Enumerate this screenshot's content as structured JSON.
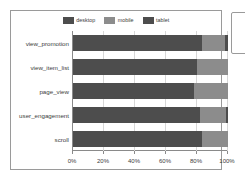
{
  "chart_data": {
    "type": "bar",
    "orientation": "horizontal",
    "stacked": true,
    "normalized": "100%",
    "title": "",
    "subtitle": "",
    "xlabel": "",
    "ylabel": "",
    "xlim": [
      0,
      100
    ],
    "grid": true,
    "legend_position": "top-center",
    "xticks": [
      "0%",
      "20%",
      "40%",
      "60%",
      "80%",
      "100%"
    ],
    "xtick_values": [
      0,
      20,
      40,
      60,
      80,
      100
    ],
    "categories": [
      "view_promotion",
      "view_item_list",
      "page_view",
      "user_engagement",
      "scroll"
    ],
    "series": [
      {
        "name": "desktop",
        "color": "#4d4d4d",
        "values": [
          83.0,
          80.0,
          78.0,
          82.0,
          83.5
        ]
      },
      {
        "name": "mobile",
        "color": "#8c8c8c",
        "values": [
          15.0,
          20.0,
          22.0,
          17.0,
          16.5
        ]
      },
      {
        "name": "tablet",
        "color": "#4d4d4d",
        "values": [
          2.0,
          0.0,
          0.0,
          1.0,
          0.0
        ]
      }
    ]
  },
  "legend": {
    "items": [
      {
        "label": "desktop",
        "color": "#4d4d4d"
      },
      {
        "label": "mobile",
        "color": "#8c8c8c"
      },
      {
        "label": "tablet",
        "color": "#4d4d4d"
      }
    ]
  },
  "colors": {
    "desktop": "#4d4d4d",
    "mobile": "#8c8c8c",
    "tablet": "#4d4d4d",
    "axis": "#8a8a8a",
    "grid": "#d7d7d7",
    "border": "#9a9a9a",
    "background": "#ffffff",
    "text": "#3c3c3c"
  }
}
